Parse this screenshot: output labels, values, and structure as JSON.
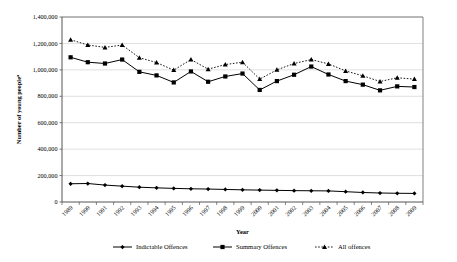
{
  "chart_data": {
    "type": "line",
    "title": "",
    "xlabel": "Year",
    "ylabel": "Number of young peopleᵃ",
    "ylabel_base": "Number of young people",
    "ylabel_sup": "a",
    "x": [
      1989,
      1990,
      1991,
      1992,
      1993,
      1994,
      1995,
      1996,
      1997,
      1998,
      1999,
      2000,
      2001,
      2002,
      2003,
      2004,
      2005,
      2006,
      2007,
      2008,
      2009
    ],
    "xtick_labels": [
      "1989",
      "1990",
      "1991",
      "1992",
      "1993",
      "1994",
      "1995",
      "1996",
      "1997",
      "1998",
      "1999",
      "2000",
      "2001",
      "2002",
      "2003",
      "2004",
      "2005",
      "2006",
      "2007",
      "2008",
      "2009"
    ],
    "ylim": [
      0,
      1400000
    ],
    "ytick_values": [
      0,
      200000,
      400000,
      600000,
      800000,
      1000000,
      1200000,
      1400000
    ],
    "ytick_labels": [
      "0",
      "200,000",
      "400,000",
      "600,000",
      "800,000",
      "1,000,000",
      "1,200,000",
      "1,400,000"
    ],
    "grid": true,
    "grid_axis": "y",
    "legend_position": "bottom",
    "series": [
      {
        "name": "Indictable Offences",
        "marker": "diamond",
        "linestyle": "solid",
        "color": "#000000",
        "values": [
          138000,
          140000,
          128000,
          120000,
          112000,
          107000,
          103000,
          100000,
          98000,
          95000,
          92000,
          90000,
          88000,
          86000,
          85000,
          84000,
          78000,
          72000,
          68000,
          66000,
          65000
        ]
      },
      {
        "name": "Summary Offences",
        "marker": "square",
        "linestyle": "solid",
        "color": "#000000",
        "values": [
          1095000,
          1058000,
          1048000,
          1078000,
          985000,
          958000,
          905000,
          988000,
          910000,
          950000,
          972000,
          848000,
          915000,
          963000,
          1025000,
          965000,
          915000,
          888000,
          845000,
          875000,
          870000
        ]
      },
      {
        "name": "All offences",
        "marker": "triangle",
        "linestyle": "dotted",
        "color": "#000000",
        "values": [
          1228000,
          1188000,
          1170000,
          1188000,
          1092000,
          1055000,
          998000,
          1078000,
          1005000,
          1040000,
          1058000,
          930000,
          1000000,
          1048000,
          1078000,
          1045000,
          992000,
          955000,
          912000,
          940000,
          930000
        ]
      }
    ]
  },
  "axes": {
    "plot_left": 62,
    "plot_right": 423,
    "plot_top": 17,
    "plot_bottom": 202
  },
  "legend": {
    "items": [
      {
        "label": "Indictable Offences",
        "marker": "diamond",
        "linestyle": "solid"
      },
      {
        "label": "Summary Offences",
        "marker": "square",
        "linestyle": "solid"
      },
      {
        "label": "All offences",
        "marker": "triangle",
        "linestyle": "dotted"
      }
    ]
  }
}
